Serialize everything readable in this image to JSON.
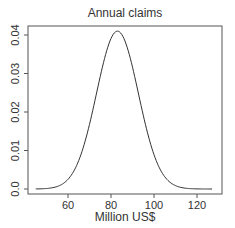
{
  "chart_data": {
    "type": "line",
    "title": "Annual claims",
    "xlabel": "Million US$",
    "ylabel": "",
    "xlim": [
      45,
      127
    ],
    "ylim": [
      0.0,
      0.041
    ],
    "x_ticks": [
      60,
      80,
      100,
      120
    ],
    "x_tick_labels": [
      "60",
      "80",
      "100",
      "120"
    ],
    "y_ticks": [
      0.0,
      0.01,
      0.02,
      0.03,
      0.04
    ],
    "y_tick_labels": [
      "0.0",
      "0.01",
      "0.02",
      "0.03",
      "0.04"
    ],
    "grid": false,
    "legend": null,
    "series": [
      {
        "name": "density",
        "description": "Normal density curve, mean ≈ 83, sd ≈ 9.7",
        "x": [
          45,
          50,
          55,
          60,
          65,
          70,
          75,
          80,
          83,
          85,
          90,
          95,
          100,
          105,
          110,
          115,
          120,
          127
        ],
        "values": [
          0.0002,
          0.0011,
          0.004,
          0.0111,
          0.0217,
          0.033,
          0.039,
          0.0392,
          0.041,
          0.04,
          0.0317,
          0.0191,
          0.0089,
          0.0031,
          0.0008,
          0.0002,
          0.0,
          0.0
        ]
      }
    ]
  }
}
